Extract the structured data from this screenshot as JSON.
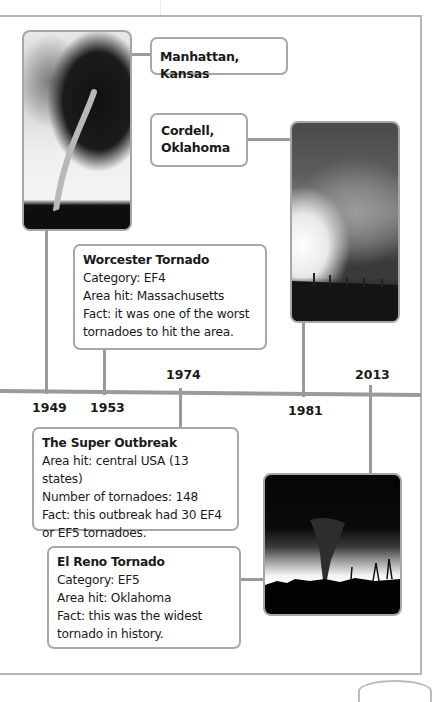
{
  "timeline": {
    "events": [
      {
        "year": "1949",
        "label": "Manhattan, Kansas",
        "image": "tornado-photo-rope"
      },
      {
        "year": "1953",
        "title": "Worcester Tornado",
        "lines": [
          "Category: EF4",
          "Area hit: Massachusetts",
          "Fact:  it was one of the worst",
          "tornadoes to hit the area."
        ]
      },
      {
        "year": "1974",
        "title": "The Super Outbreak",
        "lines": [
          "Area hit: central USA (13 states)",
          "Number of tornadoes: 148",
          "Fact:  this outbreak had 30 EF4",
          "or EF5 tornadoes."
        ]
      },
      {
        "year": "1981",
        "label_line1": "Cordell,",
        "label_line2": "Oklahoma",
        "image": "tornado-photo-wedge"
      },
      {
        "year": "2013",
        "title": "El Reno Tornado",
        "lines": [
          "Category: EF5",
          "Area hit: Oklahoma",
          "Fact:  this was the widest",
          "tornado in history."
        ],
        "image": "tornado-photo-silhouette"
      }
    ]
  },
  "colors": {
    "line": "#9a9a9a",
    "border": "#a8a8a8",
    "text": "#1a1a1a"
  }
}
